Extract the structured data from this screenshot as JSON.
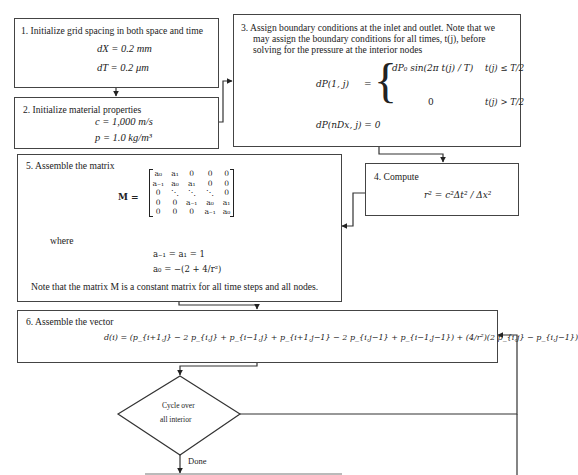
{
  "diagram": {
    "type": "flowchart",
    "steps": [
      {
        "id": 1,
        "title": "1. Initialize grid spacing in both space and time",
        "equations": [
          "dX = 0.2 mm",
          "dT = 0.2 μm"
        ]
      },
      {
        "id": 2,
        "title": "2. Initialize material properties",
        "equations": [
          "c = 1,000 m/s",
          "p = 1.0 kg/m³"
        ]
      },
      {
        "id": 3,
        "title": "3. Assign boundary conditions at the inlet and outlet. Note that we may assign the boundary conditions for all times, t(j), before solving for the pressure at the interior nodes",
        "title_lines": [
          "3. Assign boundary conditions at the inlet and outlet. Note that we",
          "may assign the boundary conditions for all times, t(j), before",
          "solving for the pressure at the interior nodes"
        ],
        "equations": {
          "lhs1": "dP(1, j)",
          "case1_expr": "dP₀ sin(2π t(j) / T)",
          "case1_cond": "t(j) ≤ T/2",
          "case2_expr": "0",
          "case2_cond": "t(j) > T/2",
          "line2": "dP(nDx, j) = 0"
        }
      },
      {
        "id": 4,
        "title": "4. Compute",
        "equations": [
          "r² = c²Δt² / Δx²"
        ]
      },
      {
        "id": 5,
        "title": "5. Assemble the matrix",
        "matrix_label": "M =",
        "matrix": [
          [
            "a₀",
            "a₁",
            "0",
            "0",
            "0"
          ],
          [
            "a₋₁",
            "a₀",
            "a₁",
            "0",
            "0"
          ],
          [
            "0",
            "⋱",
            "⋱",
            "⋱",
            "0"
          ],
          [
            "0",
            "0",
            "a₋₁",
            "a₀",
            "a₁"
          ],
          [
            "0",
            "0",
            "0",
            "a₋₁",
            "a₀"
          ]
        ],
        "where_label": "where",
        "definitions": [
          "a₋₁ = a₁ = 1",
          "a₀ = −(2 + 4/r²)"
        ],
        "note": "Note that the matrix M is a constant matrix for all time steps and all nodes."
      },
      {
        "id": 6,
        "title": "6. Assemble the vector",
        "equations": [
          "d(i) = (p_{i+1,j} − 2 p_{i,j} + p_{i−1,j} + p_{i+1,j−1} − 2 p_{i,j−1} + p_{i−1,j−1}) + (4/r²)(2 p_{i,j} − p_{i,j−1})"
        ]
      }
    ],
    "decision": {
      "label_line1": "Cycle over",
      "label_line2": "all interior",
      "exit_label": "Done"
    },
    "edges": [
      {
        "from": 1,
        "to": 2
      },
      {
        "from": 2,
        "to": 3
      },
      {
        "from": 3,
        "to": 4
      },
      {
        "from": 4,
        "to": 5
      },
      {
        "from": 5,
        "to": 6
      },
      {
        "from": 6,
        "to": "decision"
      },
      {
        "from": "decision",
        "to": 6,
        "label": "loop"
      },
      {
        "from": "decision",
        "to": "next",
        "label": "Done"
      }
    ],
    "colors": {
      "line": "#444444",
      "text": "#222222",
      "background": "#ffffff"
    }
  }
}
